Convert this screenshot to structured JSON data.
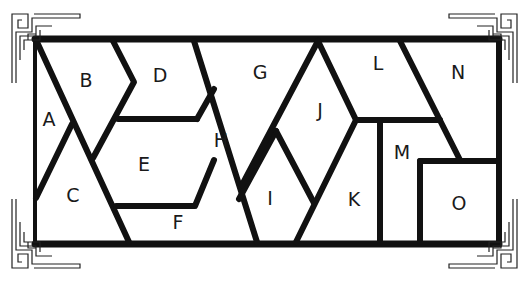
{
  "diagram": {
    "type": "region-puzzle",
    "regions": [
      {
        "id": "A",
        "label": "A",
        "x": 49,
        "y": 119
      },
      {
        "id": "B",
        "label": "B",
        "x": 86,
        "y": 80
      },
      {
        "id": "C",
        "label": "C",
        "x": 73,
        "y": 195
      },
      {
        "id": "D",
        "label": "D",
        "x": 160,
        "y": 75
      },
      {
        "id": "E",
        "label": "E",
        "x": 144,
        "y": 164
      },
      {
        "id": "F",
        "label": "F",
        "x": 178,
        "y": 222
      },
      {
        "id": "G",
        "label": "G",
        "x": 260,
        "y": 72
      },
      {
        "id": "H",
        "label": "H",
        "x": 221,
        "y": 140
      },
      {
        "id": "I",
        "label": "I",
        "x": 270,
        "y": 198
      },
      {
        "id": "J",
        "label": "J",
        "x": 320,
        "y": 110
      },
      {
        "id": "K",
        "label": "K",
        "x": 354,
        "y": 199
      },
      {
        "id": "L",
        "label": "L",
        "x": 378,
        "y": 63
      },
      {
        "id": "M",
        "label": "M",
        "x": 402,
        "y": 152
      },
      {
        "id": "N",
        "label": "N",
        "x": 458,
        "y": 72
      },
      {
        "id": "O",
        "label": "O",
        "x": 459,
        "y": 203
      }
    ],
    "colors": {
      "line": "#111111",
      "text": "#1a1a1a",
      "background": "#ffffff"
    }
  }
}
